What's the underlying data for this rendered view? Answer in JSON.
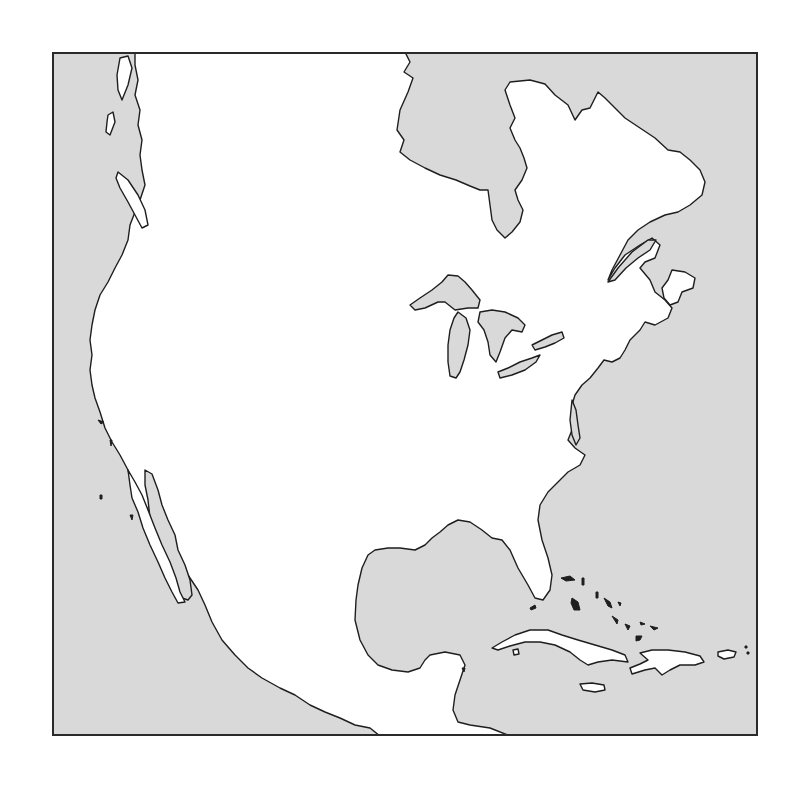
{
  "map": {
    "subject": "North America outline map",
    "style": "blank outline, no labels",
    "colors": {
      "ocean": "#d9d9d9",
      "land": "#ffffff",
      "coastline": "#1e1e1e",
      "frame": "#2a2a2a"
    },
    "features": [
      {
        "name": "Hudson Bay",
        "type": "water-body"
      },
      {
        "name": "James Bay",
        "type": "water-body"
      },
      {
        "name": "Labrador / Quebec",
        "type": "landmass"
      },
      {
        "name": "Gulf of St. Lawrence",
        "type": "water-body"
      },
      {
        "name": "Newfoundland",
        "type": "island"
      },
      {
        "name": "Nova Scotia",
        "type": "landmass"
      },
      {
        "name": "Lake Superior",
        "type": "lake"
      },
      {
        "name": "Lake Michigan",
        "type": "lake"
      },
      {
        "name": "Lake Huron",
        "type": "lake"
      },
      {
        "name": "Lake Erie",
        "type": "lake"
      },
      {
        "name": "Lake Ontario",
        "type": "lake"
      },
      {
        "name": "Chesapeake Bay",
        "type": "water-body"
      },
      {
        "name": "Florida",
        "type": "landmass"
      },
      {
        "name": "Gulf of Mexico",
        "type": "water-body"
      },
      {
        "name": "Yucatan Peninsula",
        "type": "landmass"
      },
      {
        "name": "Gulf of California",
        "type": "water-body"
      },
      {
        "name": "Baja California",
        "type": "landmass"
      },
      {
        "name": "Cuba",
        "type": "island"
      },
      {
        "name": "Hispaniola",
        "type": "island"
      },
      {
        "name": "Jamaica",
        "type": "island"
      },
      {
        "name": "Puerto Rico",
        "type": "island"
      },
      {
        "name": "Bahamas",
        "type": "island-group"
      },
      {
        "name": "Vancouver Island",
        "type": "island"
      },
      {
        "name": "Pacific Ocean",
        "type": "ocean"
      },
      {
        "name": "Atlantic Ocean",
        "type": "ocean"
      }
    ]
  }
}
